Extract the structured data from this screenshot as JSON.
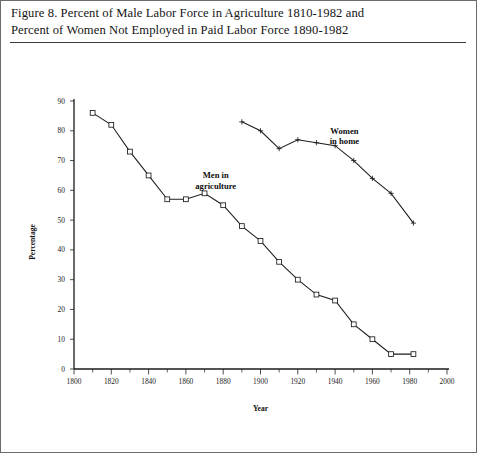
{
  "caption": {
    "line1": "Figure 8. Percent of Male Labor Force in Agriculture 1810-1982 and",
    "line2": "Percent of Women Not Employed in Paid Labor Force 1890-1982"
  },
  "chart_data": {
    "type": "line",
    "title": "",
    "xlabel": "Year",
    "ylabel": "Percentage",
    "xlim": [
      1800,
      2000
    ],
    "ylim": [
      0,
      90
    ],
    "xticks": [
      1800,
      1820,
      1840,
      1860,
      1880,
      1900,
      1920,
      1940,
      1960,
      1980,
      2000
    ],
    "xtick_labels": [
      "1800",
      "1820",
      "1840",
      "1860",
      "1880",
      "1900",
      "1920",
      "1940",
      "1960",
      "1980",
      "2000"
    ],
    "xminor_step": 10,
    "yticks": [
      0,
      10,
      20,
      30,
      40,
      50,
      60,
      70,
      80,
      90
    ],
    "ytick_labels": [
      "0",
      "10",
      "20",
      "30",
      "40",
      "50",
      "60",
      "70",
      "80",
      "90"
    ],
    "grid": false,
    "legend": "annotations",
    "series": [
      {
        "name": "Men in agriculture",
        "marker": "square",
        "annotation": {
          "line1": "Men in",
          "line2": "agriculture",
          "x": 1876,
          "y": 64
        },
        "x": [
          1810,
          1820,
          1830,
          1840,
          1850,
          1860,
          1870,
          1880,
          1890,
          1900,
          1910,
          1920,
          1930,
          1940,
          1950,
          1960,
          1970,
          1982
        ],
        "values": [
          86,
          82,
          73,
          65,
          57,
          57,
          59,
          55,
          48,
          43,
          36,
          30,
          25,
          23,
          15,
          10,
          5,
          5
        ]
      },
      {
        "name": "Women in home",
        "marker": "cross",
        "annotation": {
          "line1": "Women",
          "line2": "in home",
          "x": 1945,
          "y": 79
        },
        "x": [
          1890,
          1900,
          1910,
          1920,
          1930,
          1940,
          1950,
          1960,
          1970,
          1982
        ],
        "values": [
          83,
          80,
          74,
          77,
          76,
          75,
          70,
          64,
          59,
          49
        ]
      }
    ]
  }
}
